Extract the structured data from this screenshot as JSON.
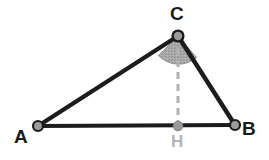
{
  "figure": {
    "name": "triangle-with-altitude",
    "background_color": "#ffffff"
  },
  "colors": {
    "edge": "#1c1c1c",
    "vertex_fill": "#9a9a9a",
    "vertex_stroke": "#1c1c1c",
    "altitude": "#b0b0b0",
    "angle_sector_fill": "#a8a8a8",
    "angle_sector_stroke": "#8f8f8f",
    "label": "#1a1a1a",
    "label_muted": "#b5b5b5"
  },
  "points": {
    "A": {
      "label": "A",
      "x": 38,
      "y": 126
    },
    "B": {
      "label": "B",
      "x": 235,
      "y": 125
    },
    "C": {
      "label": "C",
      "x": 178,
      "y": 36
    },
    "H": {
      "label": "H",
      "x": 178,
      "y": 126
    }
  },
  "edges": [
    {
      "name": "side-AB",
      "from": "A",
      "to": "B",
      "style": "solid",
      "width": 4
    },
    {
      "name": "side-AC",
      "from": "A",
      "to": "C",
      "style": "solid",
      "width": 4
    },
    {
      "name": "side-BC",
      "from": "B",
      "to": "C",
      "style": "solid",
      "width": 4
    }
  ],
  "altitude": {
    "name": "altitude-CH",
    "from": "C",
    "to": "H",
    "style": "dashed",
    "width": 3,
    "dash_pattern": "7 5"
  },
  "angle_marker": {
    "name": "angle-at-C",
    "at_vertex": "C",
    "radius": 22,
    "fill": "#a8a8a8"
  },
  "labels": {
    "A": "A",
    "B": "B",
    "C": "C",
    "H": "H"
  }
}
